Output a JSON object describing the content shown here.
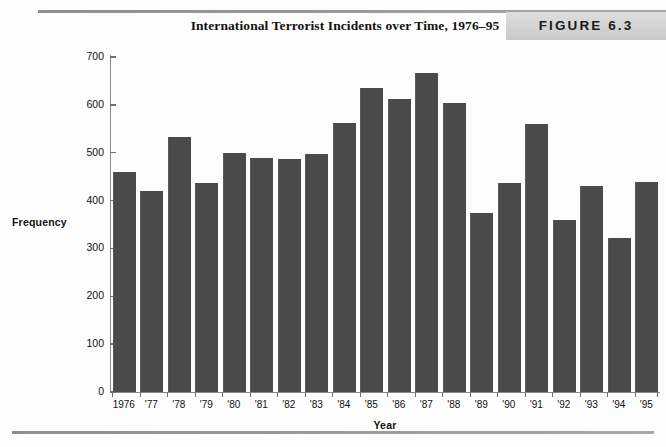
{
  "figure": {
    "title": "International Terrorist Incidents over Time, 1976–95",
    "badge_label": "FIGURE 6.3",
    "badge_color": "#d2d2d2",
    "bar_color": "#4a4a4a",
    "axis_color": "#8a8a8a"
  },
  "chart_data": {
    "type": "bar",
    "title": "International Terrorist Incidents over Time, 1976–95",
    "xlabel": "Year",
    "ylabel": "Frequency",
    "ylim": [
      0,
      700
    ],
    "ytick_values": [
      0,
      100,
      200,
      300,
      400,
      500,
      600,
      700
    ],
    "ytick_labels": [
      "0",
      "100",
      "200",
      "300",
      "400",
      "500",
      "600",
      "700"
    ],
    "grid": false,
    "legend": null,
    "categories": [
      "1976",
      "'77",
      "'78",
      "'79",
      "'80",
      "'81",
      "'82",
      "'83",
      "'84",
      "'85",
      "'86",
      "'87",
      "'88",
      "'89",
      "'90",
      "'91",
      "'92",
      "'93",
      "'94",
      "'95"
    ],
    "values": [
      460,
      420,
      533,
      436,
      499,
      489,
      487,
      497,
      562,
      636,
      613,
      667,
      604,
      373,
      437,
      561,
      360,
      430,
      322,
      439
    ]
  }
}
